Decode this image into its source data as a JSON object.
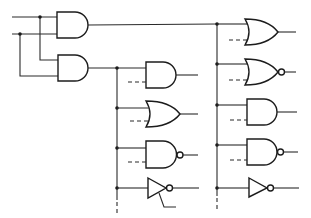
{
  "diagram": {
    "type": "logic-circuit",
    "title": "",
    "colors": {
      "line": "#2a2a2a",
      "background": "#ffffff"
    },
    "inputs": [
      {
        "id": "in-a",
        "label": ""
      },
      {
        "id": "in-b",
        "label": ""
      }
    ],
    "input_stage": [
      {
        "id": "and-1",
        "type": "AND",
        "inputs": [
          "in-a",
          "in-b"
        ],
        "output_to": "bus-right"
      },
      {
        "id": "and-2",
        "type": "AND",
        "inputs": [
          "in-a",
          "in-b"
        ],
        "output_to": "bus-middle"
      }
    ],
    "middle_column": {
      "bus": "bus-middle",
      "gates": [
        {
          "id": "m-and",
          "type": "AND",
          "second_input": "dashed"
        },
        {
          "id": "m-or",
          "type": "OR",
          "second_input": "dashed"
        },
        {
          "id": "m-nand",
          "type": "NAND",
          "second_input": "dashed"
        },
        {
          "id": "m-not",
          "type": "NOT",
          "second_input": "control-line"
        }
      ],
      "bus_continues": true
    },
    "right_column": {
      "bus": "bus-right",
      "gates": [
        {
          "id": "r-or",
          "type": "OR",
          "second_input": "dashed"
        },
        {
          "id": "r-nor",
          "type": "NOR",
          "second_input": "dashed"
        },
        {
          "id": "r-and",
          "type": "AND",
          "second_input": "dashed"
        },
        {
          "id": "r-nand",
          "type": "NAND",
          "second_input": "dashed"
        },
        {
          "id": "r-not",
          "type": "NOT",
          "second_input": "none"
        }
      ],
      "bus_continues": true
    }
  }
}
